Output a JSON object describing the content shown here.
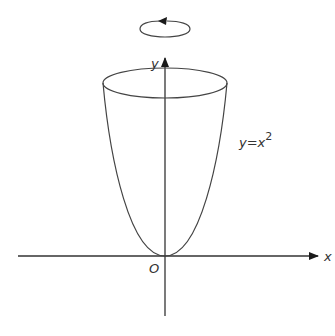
{
  "diagram": {
    "labels": {
      "y_axis": "y",
      "x_axis": "x",
      "origin": "O",
      "curve_base": "y=x",
      "curve_exp": "2"
    },
    "elements": [
      {
        "type": "rotation-arrow",
        "direction": "anticlockwise",
        "about": "y-axis"
      },
      {
        "type": "axis",
        "name": "x",
        "arrow": "right"
      },
      {
        "type": "axis",
        "name": "y",
        "arrow": "up"
      },
      {
        "type": "curve",
        "equation": "y=x^2",
        "shape": "parabola"
      },
      {
        "type": "ellipse",
        "meaning": "top rim of the solid"
      }
    ],
    "colors": {
      "stroke": "#333333",
      "background": "#ffffff"
    }
  }
}
